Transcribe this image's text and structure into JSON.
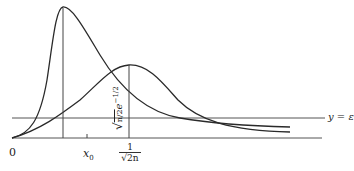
{
  "figure": {
    "type": "function-curves-diagram",
    "stroke_color": "#2a2a2a",
    "background": "#ffffff"
  },
  "labels": {
    "origin": "0",
    "x0": "x",
    "x0_sub": "0",
    "epsilon_line": "y = ε",
    "peak_x_num": "1",
    "peak_x_den": "√2n",
    "peak_y_sqrt": "√",
    "peak_y_frac": "n/2",
    "peak_y_exp": "e",
    "peak_y_exp_power": "−1/2"
  },
  "geometry": {
    "baseline_y": 138,
    "epsilon_y": 118,
    "tall_curve_peak": [
      63,
      7
    ],
    "wide_curve_peak": [
      129,
      65
    ],
    "x0_tick": 87
  }
}
